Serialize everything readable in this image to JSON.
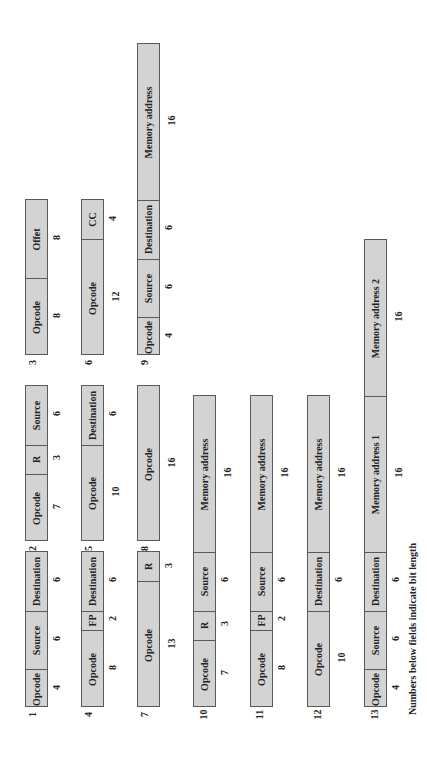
{
  "footnote": "Numbers below fields indicate bit length",
  "colors": {
    "field_fill": "#d3d3d3",
    "border": "#5a5a5a",
    "text": "#222222"
  },
  "layout": {
    "px_per_bit": 9.75,
    "box_width": 23
  },
  "formats": [
    {
      "id": "1",
      "x": 25,
      "bottom": 707,
      "fields": [
        {
          "label": "Opcode",
          "bits": 4
        },
        {
          "label": "Source",
          "bits": 6
        },
        {
          "label": "Destination",
          "bits": 6
        }
      ]
    },
    {
      "id": "2",
      "x": 25,
      "bottom": 541,
      "fields": [
        {
          "label": "Opcode",
          "bits": 7
        },
        {
          "label": "R",
          "bits": 3
        },
        {
          "label": "Source",
          "bits": 6
        }
      ]
    },
    {
      "id": "3",
      "x": 25,
      "bottom": 355,
      "fields": [
        {
          "label": "Opcode",
          "bits": 8
        },
        {
          "label": "Offet",
          "bits": 8
        }
      ]
    },
    {
      "id": "4",
      "x": 81,
      "bottom": 707,
      "fields": [
        {
          "label": "Opcode",
          "bits": 8
        },
        {
          "label": "FP",
          "bits": 2
        },
        {
          "label": "Destination",
          "bits": 6
        }
      ]
    },
    {
      "id": "5",
      "x": 81,
      "bottom": 541,
      "fields": [
        {
          "label": "Opcode",
          "bits": 10
        },
        {
          "label": "Destination",
          "bits": 6
        }
      ]
    },
    {
      "id": "6",
      "x": 81,
      "bottom": 355,
      "fields": [
        {
          "label": "Opcode",
          "bits": 12
        },
        {
          "label": "CC",
          "bits": 4
        }
      ]
    },
    {
      "id": "7",
      "x": 137,
      "bottom": 707,
      "fields": [
        {
          "label": "Opcode",
          "bits": 13
        },
        {
          "label": "R",
          "bits": 3
        }
      ]
    },
    {
      "id": "8",
      "x": 137,
      "bottom": 541,
      "fields": [
        {
          "label": "Opcode",
          "bits": 16
        }
      ]
    },
    {
      "id": "9",
      "x": 137,
      "bottom": 355,
      "fields": [
        {
          "label": "Opcode",
          "bits": 4
        },
        {
          "label": "Source",
          "bits": 6
        },
        {
          "label": "Destination",
          "bits": 6
        },
        {
          "label": "Memory address",
          "bits": 16
        }
      ]
    },
    {
      "id": "10",
      "x": 193,
      "bottom": 707,
      "fields": [
        {
          "label": "Opcode",
          "bits": 7
        },
        {
          "label": "R",
          "bits": 3
        },
        {
          "label": "Source",
          "bits": 6
        },
        {
          "label": "Memory address",
          "bits": 16
        }
      ]
    },
    {
      "id": "11",
      "x": 250,
      "bottom": 707,
      "fields": [
        {
          "label": "Opcode",
          "bits": 8
        },
        {
          "label": "FP",
          "bits": 2
        },
        {
          "label": "Source",
          "bits": 6
        },
        {
          "label": "Memory address",
          "bits": 16
        }
      ]
    },
    {
      "id": "12",
      "x": 307,
      "bottom": 707,
      "fields": [
        {
          "label": "Opcode",
          "bits": 10
        },
        {
          "label": "Destination",
          "bits": 6
        },
        {
          "label": "Memory address",
          "bits": 16
        }
      ]
    },
    {
      "id": "13",
      "x": 364,
      "bottom": 707,
      "fields": [
        {
          "label": "Opcode",
          "bits": 4
        },
        {
          "label": "Source",
          "bits": 6
        },
        {
          "label": "Destination",
          "bits": 6
        },
        {
          "label": "Memory address 1",
          "bits": 16
        },
        {
          "label": "Memory address 2",
          "bits": 16
        }
      ]
    }
  ]
}
